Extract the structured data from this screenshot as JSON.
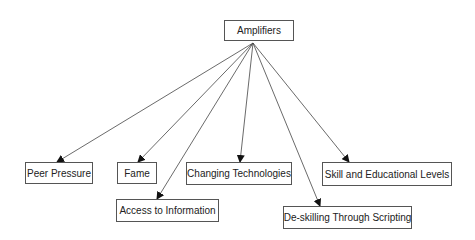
{
  "diagram": {
    "root": {
      "label": "Amplifiers",
      "x": 224,
      "y": 20,
      "w": 70,
      "h": 21
    },
    "origin": {
      "x": 253,
      "y": 43
    },
    "children": [
      {
        "label": "Peer Pressure",
        "x": 25,
        "y": 162,
        "w": 68,
        "h": 22,
        "arrow_end": {
          "x": 57,
          "y": 162
        }
      },
      {
        "label": "Fame",
        "x": 117,
        "y": 162,
        "w": 40,
        "h": 22,
        "arrow_end": {
          "x": 138,
          "y": 162
        }
      },
      {
        "label": "Access to Information",
        "x": 116,
        "y": 199,
        "w": 103,
        "h": 23,
        "arrow_end": {
          "x": 157,
          "y": 199
        }
      },
      {
        "label": "Changing Technologies",
        "x": 186,
        "y": 162,
        "w": 106,
        "h": 23,
        "arrow_end": {
          "x": 240,
          "y": 162
        }
      },
      {
        "label": "De-skilling Through Scripting",
        "x": 283,
        "y": 206,
        "w": 129,
        "h": 23,
        "arrow_end": {
          "x": 320,
          "y": 206
        }
      },
      {
        "label": "Skill and Educational Levels",
        "x": 322,
        "y": 162,
        "w": 130,
        "h": 24,
        "arrow_end": {
          "x": 349,
          "y": 162
        }
      }
    ],
    "line_color": "#444444"
  }
}
